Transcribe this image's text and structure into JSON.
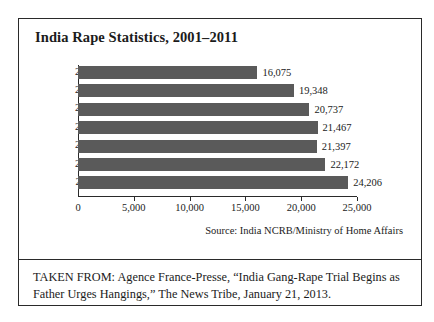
{
  "figure": {
    "title": "India Rape Statistics, 2001–2011",
    "source": "Source: India NCRB/Ministry of Home Affairs",
    "caption": "TAKEN FROM: Agence France-Presse, “India Gang-Rape Trial Begins as Father Urges Hangings,” The News Tribe, January 21, 2013."
  },
  "colors": {
    "bar": "#5a5a5a",
    "axis": "#2a2a2a",
    "frame": "#2a2a2a",
    "text": "#1b1b1b",
    "background": "#ffffff"
  },
  "chart_data": {
    "type": "bar",
    "orientation": "horizontal",
    "title": "India Rape Statistics, 2001–2011",
    "xlabel": "",
    "ylabel": "",
    "categories": [
      "2001",
      "2006",
      "2007",
      "2008",
      "2009",
      "2010",
      "2011"
    ],
    "values": [
      16075,
      19348,
      20737,
      21467,
      21397,
      22172,
      24206
    ],
    "value_labels": [
      "16,075",
      "19,348",
      "20,737",
      "21,467",
      "21,397",
      "22,172",
      "24,206"
    ],
    "xlim": [
      0,
      25000
    ],
    "xticks": [
      0,
      5000,
      10000,
      15000,
      20000,
      25000
    ],
    "xtick_labels": [
      "0",
      "5,000",
      "10,000",
      "15,000",
      "20,000",
      "25,000"
    ],
    "grid": false,
    "legend": false,
    "series": [
      {
        "name": "Reported rape cases",
        "values": [
          16075,
          19348,
          20737,
          21467,
          21397,
          22172,
          24206
        ]
      }
    ]
  }
}
